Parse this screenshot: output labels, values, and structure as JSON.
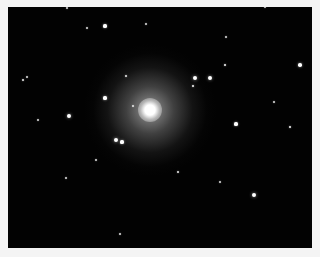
{
  "image": {
    "subject": "elliptical galaxy in star field",
    "background_color": "#020202",
    "border_color": "#f4f4f4",
    "galaxy": {
      "cx": 150,
      "cy": 110,
      "core_radius": 6,
      "halo_radius": 42
    },
    "stars": [
      {
        "x": 105,
        "y": 26,
        "r": 1.6
      },
      {
        "x": 146,
        "y": 24,
        "r": 1.0
      },
      {
        "x": 87,
        "y": 28,
        "r": 1.0
      },
      {
        "x": 67,
        "y": 8,
        "r": 1.0
      },
      {
        "x": 265,
        "y": 7,
        "r": 1.0
      },
      {
        "x": 226,
        "y": 37,
        "r": 1.0
      },
      {
        "x": 300,
        "y": 65,
        "r": 1.8
      },
      {
        "x": 225,
        "y": 65,
        "r": 1.4
      },
      {
        "x": 195,
        "y": 78,
        "r": 2.4
      },
      {
        "x": 210,
        "y": 78,
        "r": 2.2
      },
      {
        "x": 193,
        "y": 86,
        "r": 1.4
      },
      {
        "x": 126,
        "y": 76,
        "r": 1.2
      },
      {
        "x": 23,
        "y": 80,
        "r": 1.2
      },
      {
        "x": 27,
        "y": 77,
        "r": 1.0
      },
      {
        "x": 105,
        "y": 98,
        "r": 1.6
      },
      {
        "x": 69,
        "y": 116,
        "r": 2.2
      },
      {
        "x": 38,
        "y": 120,
        "r": 1.0
      },
      {
        "x": 133,
        "y": 106,
        "r": 1.0
      },
      {
        "x": 116,
        "y": 140,
        "r": 2.2
      },
      {
        "x": 122,
        "y": 142,
        "r": 1.6
      },
      {
        "x": 236,
        "y": 124,
        "r": 1.6
      },
      {
        "x": 290,
        "y": 127,
        "r": 1.4
      },
      {
        "x": 178,
        "y": 172,
        "r": 1.2
      },
      {
        "x": 254,
        "y": 195,
        "r": 2.4
      },
      {
        "x": 220,
        "y": 182,
        "r": 1.0
      },
      {
        "x": 120,
        "y": 234,
        "r": 1.0
      },
      {
        "x": 66,
        "y": 178,
        "r": 1.0
      },
      {
        "x": 96,
        "y": 160,
        "r": 1.0
      },
      {
        "x": 274,
        "y": 102,
        "r": 1.0
      }
    ]
  }
}
